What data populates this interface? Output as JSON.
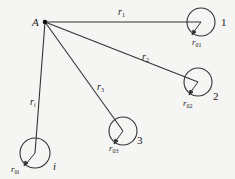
{
  "diagram": {
    "point": {
      "label": "A",
      "x": 45,
      "y": 22
    },
    "lines": [
      {
        "label": "r",
        "sub": "1",
        "x2": 201,
        "y2": 22,
        "lx": 120,
        "ly": 15
      },
      {
        "label": "r",
        "sub": "2",
        "x2": 198,
        "y2": 82,
        "lx": 143,
        "ly": 60
      },
      {
        "label": "r",
        "sub": "3",
        "x2": 123,
        "y2": 131,
        "lx": 98,
        "ly": 90
      },
      {
        "label": "r",
        "sub": "i",
        "x2": 35,
        "y2": 153,
        "lx": 31,
        "ly": 105
      }
    ],
    "circles": [
      {
        "id": "1",
        "cx": 201,
        "cy": 22,
        "r": 14,
        "num_label": "1",
        "nx": 222,
        "ny": 26,
        "radius_label": "r",
        "radius_sub": "01",
        "rlx": 193,
        "rly": 45
      },
      {
        "id": "2",
        "cx": 198,
        "cy": 82,
        "r": 14,
        "num_label": "2",
        "nx": 214,
        "ny": 99,
        "radius_label": "r",
        "radius_sub": "02",
        "rlx": 184,
        "rly": 106
      },
      {
        "id": "3",
        "cx": 123,
        "cy": 131,
        "r": 14,
        "num_label": "3",
        "nx": 137,
        "ny": 144,
        "radius_label": "r",
        "radius_sub": "03",
        "rlx": 110,
        "rly": 150
      },
      {
        "id": "i",
        "cx": 35,
        "cy": 153,
        "r": 15,
        "num_label": "i",
        "nx": 53,
        "ny": 170,
        "radius_label": "r",
        "radius_sub": "0i",
        "rlx": 12,
        "rly": 172
      }
    ]
  },
  "labels": {
    "point_A": "A",
    "r1": "r",
    "r1_sub": "1",
    "r2": "r",
    "r2_sub": "2",
    "r3": "r",
    "r3_sub": "3",
    "ri": "r",
    "ri_sub": "i",
    "c1": "1",
    "c2": "2",
    "c3": "3",
    "ci": "i",
    "r01": "r",
    "r01_sub": "01",
    "r02": "r",
    "r02_sub": "02",
    "r03": "r",
    "r03_sub": "03",
    "r0i": "r",
    "r0i_sub": "0i"
  },
  "colors": {
    "stroke": "#333333",
    "background": "#f5f5f3"
  }
}
